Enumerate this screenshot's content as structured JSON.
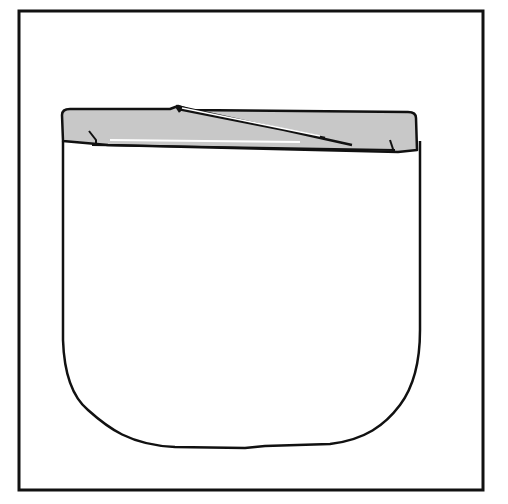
{
  "illustration": {
    "subject": "pocket-shape",
    "colors": {
      "background": "#ffffff",
      "stroke": "#111111",
      "fill_band": "#c8c8c8"
    }
  }
}
